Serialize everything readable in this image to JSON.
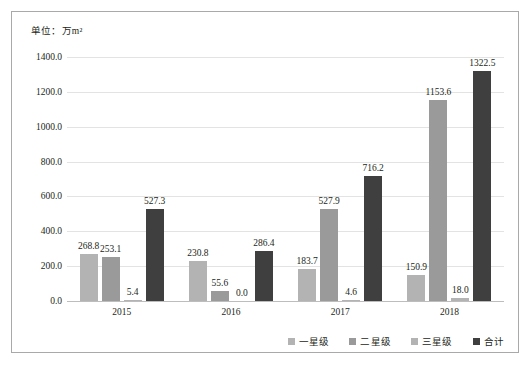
{
  "unit_caption": "单位：万m²",
  "colors": {
    "series_1": "#b3b3b3",
    "series_2": "#9a9a9a",
    "series_3": "#b3b3b3",
    "series_4": "#3f3f3f",
    "gridline": "#e3e3e3",
    "baseline": "#bdbdbd",
    "frame_border": "#a9a9a9",
    "text": "#231f20",
    "background": "#ffffff"
  },
  "chart_data": {
    "type": "bar",
    "title": "",
    "subtitle": "",
    "xlabel": "",
    "ylabel": "",
    "unit": "单位：万m²",
    "categories": [
      "2015",
      "2016",
      "2017",
      "2018"
    ],
    "series": [
      {
        "name": "一星级",
        "values": [
          268.8,
          230.8,
          183.7,
          150.9
        ],
        "color": "#b3b3b3"
      },
      {
        "name": "二星级",
        "values": [
          253.1,
          55.6,
          527.9,
          1153.6
        ],
        "color": "#9a9a9a"
      },
      {
        "name": "三星级",
        "values": [
          5.4,
          0.0,
          4.6,
          18.0
        ],
        "color": "#b3b3b3"
      },
      {
        "name": "合计",
        "values": [
          527.3,
          286.4,
          716.2,
          1322.5
        ],
        "color": "#3f3f3f"
      }
    ],
    "data_labels": [
      [
        "268.8",
        "253.1",
        "5.4",
        "527.3"
      ],
      [
        "230.8",
        "55.6",
        "0.0",
        "286.4"
      ],
      [
        "183.7",
        "527.9",
        "4.6",
        "716.2"
      ],
      [
        "150.9",
        "1153.6",
        "18.0",
        "1322.5"
      ]
    ],
    "ylim": [
      0,
      1400
    ],
    "ytick_step": 200,
    "ytick_labels": [
      "1400.0",
      "1200.0",
      "1000.0",
      "800.0",
      "600.0",
      "400.0",
      "200.0",
      "0.0"
    ],
    "ytick_values": [
      1400,
      1200,
      1000,
      800,
      600,
      400,
      200,
      0
    ],
    "grid": true,
    "grid_axis": "y",
    "legend_position": "bottom-right",
    "legend_entries": [
      "一星级",
      "二星级",
      "三星级",
      "合计"
    ]
  }
}
